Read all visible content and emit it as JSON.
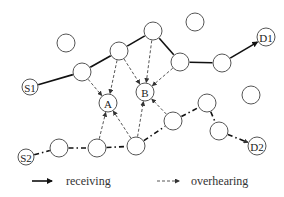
{
  "diagram": {
    "nodes": [
      {
        "id": "e1",
        "label": "",
        "x": 66,
        "y": 43,
        "r": 9
      },
      {
        "id": "S1",
        "label": "S1",
        "x": 30,
        "y": 87,
        "r": 8
      },
      {
        "id": "a",
        "label": "",
        "x": 82,
        "y": 72,
        "r": 9
      },
      {
        "id": "b",
        "label": "",
        "x": 119,
        "y": 51,
        "r": 9
      },
      {
        "id": "c",
        "label": "",
        "x": 153,
        "y": 31,
        "r": 9
      },
      {
        "id": "e2",
        "label": "",
        "x": 195,
        "y": 22,
        "r": 9
      },
      {
        "id": "d",
        "label": "",
        "x": 180,
        "y": 62,
        "r": 9
      },
      {
        "id": "e",
        "label": "",
        "x": 222,
        "y": 63,
        "r": 9
      },
      {
        "id": "D1",
        "label": "D1",
        "x": 266,
        "y": 37,
        "r": 9
      },
      {
        "id": "A",
        "label": "A",
        "x": 108,
        "y": 103,
        "r": 9
      },
      {
        "id": "B",
        "label": "B",
        "x": 145,
        "y": 92,
        "r": 9
      },
      {
        "id": "e3",
        "label": "",
        "x": 251,
        "y": 95,
        "r": 9
      },
      {
        "id": "S2",
        "label": "S2",
        "x": 26,
        "y": 157,
        "r": 8
      },
      {
        "id": "n1",
        "label": "",
        "x": 59,
        "y": 148,
        "r": 9
      },
      {
        "id": "n2",
        "label": "",
        "x": 97,
        "y": 148,
        "r": 9
      },
      {
        "id": "n3",
        "label": "",
        "x": 136,
        "y": 146,
        "r": 9
      },
      {
        "id": "n4",
        "label": "",
        "x": 173,
        "y": 121,
        "r": 9
      },
      {
        "id": "n5",
        "label": "",
        "x": 207,
        "y": 103,
        "r": 9
      },
      {
        "id": "n6",
        "label": "",
        "x": 219,
        "y": 131,
        "r": 9
      },
      {
        "id": "D2",
        "label": "D2",
        "x": 257,
        "y": 146,
        "r": 9
      }
    ],
    "edges_receiving_path1": [
      [
        "S1",
        "a"
      ],
      [
        "a",
        "b"
      ],
      [
        "b",
        "c"
      ],
      [
        "c",
        "d"
      ],
      [
        "d",
        "e"
      ],
      [
        "e",
        "D1"
      ]
    ],
    "edges_receiving_path2": [
      [
        "S2",
        "n1"
      ],
      [
        "n1",
        "n2"
      ],
      [
        "n2",
        "n3"
      ],
      [
        "n3",
        "n4"
      ],
      [
        "n4",
        "n5"
      ],
      [
        "n5",
        "n6"
      ],
      [
        "n6",
        "D2"
      ]
    ],
    "edges_overhearing": [
      [
        "a",
        "A"
      ],
      [
        "b",
        "A"
      ],
      [
        "b",
        "B"
      ],
      [
        "c",
        "B"
      ],
      [
        "d",
        "B"
      ],
      [
        "n2",
        "A"
      ],
      [
        "n3",
        "A"
      ],
      [
        "n3",
        "B"
      ],
      [
        "n4",
        "B"
      ]
    ]
  },
  "legend": {
    "receiving_label": "receiving",
    "overhearing_label": "overhearing"
  }
}
